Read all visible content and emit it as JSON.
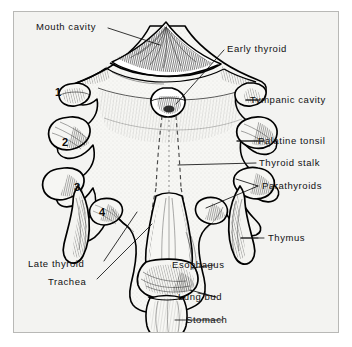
{
  "figure": {
    "background_color": "#f3f3f1",
    "frame_color": "#b8b8b6",
    "ink_color": "#111111"
  },
  "labels": {
    "mouth_cavity": "Mouth cavity",
    "early_thyroid": "Early thyroid",
    "tympanic_cavity": "Tympanic cavity",
    "palatine_tonsil": "Palatine tonsil",
    "thyroid_stalk": "Thyroid stalk",
    "parathyroids": "Parathyroids",
    "thymus": "Thymus",
    "esophagus": "Esophagus",
    "lung_bud": "Lung bud",
    "stomach": "Stomach",
    "late_thyroid": "Late thyroid",
    "trachea": "Trachea"
  },
  "pouch_numbers": {
    "one": "1",
    "two": "2",
    "three": "3",
    "four": "4"
  }
}
